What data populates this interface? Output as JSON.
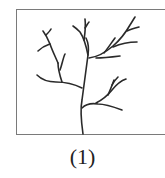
{
  "figure": {
    "caption": "(1)",
    "stroke_color": "#2a2a2a",
    "frame_color": "#7a7a7a"
  }
}
